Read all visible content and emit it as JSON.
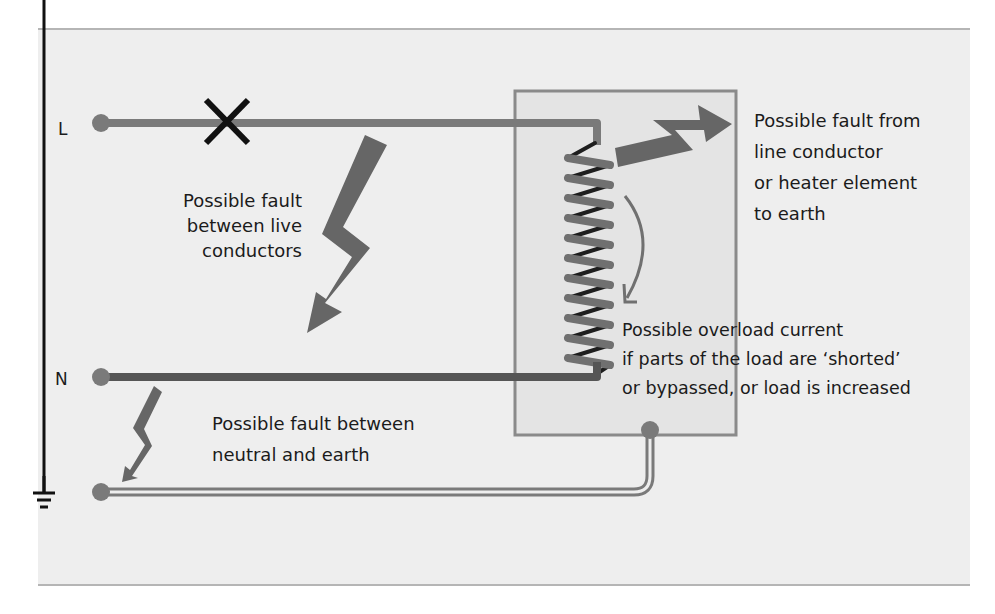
{
  "diagram": {
    "colors": {
      "background": "#eeeeee",
      "page": "#ffffff",
      "panel_border": "#b5b5b5",
      "line_conductor": "#7a7a7a",
      "neutral_conductor": "#555555",
      "earth_conductor": "#7a7a7a",
      "fault_arrow": "#666666",
      "load_box_fill": "#dcdcdc",
      "load_box_border": "#8a8a8a",
      "heater_coil": "#707070",
      "coil_shadow": "#1e1e1e",
      "fuse_cross": "#111111",
      "text": "#1b1b1b"
    },
    "terminals": {
      "line": "L",
      "neutral": "N",
      "earth": "earth-symbol"
    },
    "labels": {
      "fault_live": [
        "Possible fault",
        "between live",
        "conductors"
      ],
      "fault_earth_from_line": [
        "Possible fault from",
        "line conductor",
        "or heater element",
        "to earth"
      ],
      "overload": [
        "Possible overload current",
        "if parts of the load are ‘shorted’",
        "or bypassed, or load is increased"
      ],
      "fault_neutral_earth": [
        "Possible fault between",
        "neutral and earth"
      ]
    },
    "components": {
      "fuse_break": "cross-mark",
      "load": "heater-element-coil",
      "enclosure": "load-enclosure-box"
    }
  }
}
